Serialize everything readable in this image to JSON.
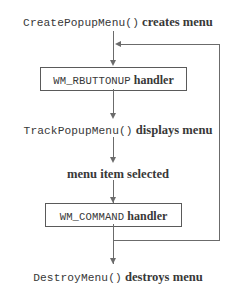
{
  "diagram": {
    "type": "flowchart",
    "colors": {
      "text": "#383838",
      "line": "#6b6b6b",
      "box_border": "#5a5a5a",
      "background": "#ffffff"
    },
    "nodes": [
      {
        "id": "create-popup-menu",
        "shape": "plain",
        "code_text": "CreatePopupMenu()",
        "label_text": " creates menu"
      },
      {
        "id": "wm-rbuttonup-handler",
        "shape": "box",
        "code_text": "WM_RBUTTONUP",
        "label_text": " handler"
      },
      {
        "id": "track-popup-menu",
        "shape": "plain",
        "code_text": "TrackPopupMenu()",
        "label_text": " displays menu"
      },
      {
        "id": "menu-item-selected",
        "shape": "plain",
        "code_text": "",
        "label_text": "menu item selected"
      },
      {
        "id": "wm-command-handler",
        "shape": "box",
        "code_text": "WM_COMMAND",
        "label_text": " handler"
      },
      {
        "id": "destroy-menu",
        "shape": "plain",
        "code_text": "DestroyMenu()",
        "label_text": " destroys menu"
      }
    ],
    "edges": [
      {
        "id": "e1",
        "from": "create-popup-menu",
        "to": "wm-rbuttonup-handler",
        "direction": "down"
      },
      {
        "id": "e2",
        "from": "wm-rbuttonup-handler",
        "to": "track-popup-menu",
        "direction": "down"
      },
      {
        "id": "e3",
        "from": "track-popup-menu",
        "to": "menu-item-selected",
        "direction": "down"
      },
      {
        "id": "e4",
        "from": "menu-item-selected",
        "to": "wm-command-handler",
        "direction": "down"
      },
      {
        "id": "e5",
        "from": "wm-command-handler",
        "to": "destroy-menu",
        "direction": "down"
      },
      {
        "id": "e6",
        "from": "wm-command-handler",
        "to": "wm-rbuttonup-handler",
        "direction": "loop-right-up"
      }
    ]
  }
}
